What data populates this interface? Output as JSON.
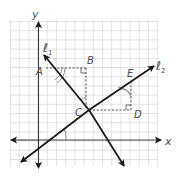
{
  "figure": {
    "axes": {
      "x_label": "x",
      "y_label": "y"
    },
    "lines": [
      {
        "id": "l1",
        "label": "ℓ",
        "subscript": "1"
      },
      {
        "id": "l2",
        "label": "ℓ",
        "subscript": "2"
      }
    ],
    "points": [
      {
        "id": "A",
        "label": "A"
      },
      {
        "id": "B",
        "label": "B"
      },
      {
        "id": "C",
        "label": "C"
      },
      {
        "id": "D",
        "label": "D"
      },
      {
        "id": "E",
        "label": "E"
      }
    ],
    "colors": {
      "grid": "#d8d8d8",
      "axis": "#3a3a3a",
      "line": "#1a1a1a",
      "dashed": "#555555",
      "label": "#4a4a4a"
    }
  }
}
